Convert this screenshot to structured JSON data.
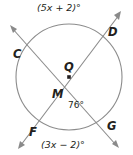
{
  "figure": {
    "type": "circle-geometry-two-secants",
    "background_color": "#ffffff",
    "stroke_color": "#8c8c8c",
    "line_color": "#8a8a8a",
    "text_color": "#231f20",
    "circle": {
      "center_label": "Q",
      "cx": 69,
      "cy": 77,
      "r": 53
    },
    "points": [
      {
        "name": "C",
        "label": "C",
        "x": 24,
        "y": 45
      },
      {
        "name": "D",
        "label": "D",
        "x": 111,
        "y": 36
      },
      {
        "name": "F",
        "label": "F",
        "x": 38,
        "y": 124
      },
      {
        "name": "G",
        "label": "G",
        "x": 104,
        "y": 124
      },
      {
        "name": "M",
        "label": "M",
        "x": 70,
        "y": 97
      }
    ],
    "center_point": {
      "label": "Q",
      "x": 69,
      "y": 77
    },
    "intersection_point": {
      "label": "M",
      "x": 70,
      "y": 97
    },
    "arc_labels": {
      "top": "(5x + 2)°",
      "bottom": "(3x − 2)°"
    },
    "angle_label": "76°",
    "secants": [
      {
        "name": "secant-CG",
        "from": "C",
        "through": "M",
        "to": "G",
        "arrow_ends": [
          "C-side",
          "G-side"
        ]
      },
      {
        "name": "secant-FD",
        "from": "F",
        "through": "M",
        "to": "D",
        "arrow_ends": [
          "F-side",
          "D-side"
        ]
      }
    ]
  }
}
